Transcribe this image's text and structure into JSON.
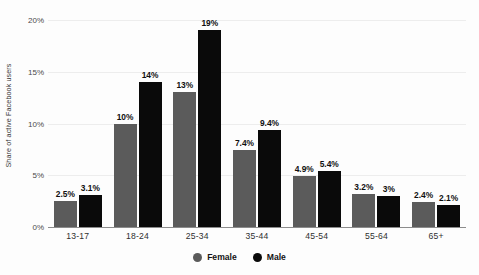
{
  "chart_data": {
    "type": "bar",
    "title": "",
    "xlabel": "",
    "ylabel": "Share of active Facebook users",
    "ylim": [
      0,
      20
    ],
    "ytick_labels": [
      "20%",
      "15%",
      "10%",
      "5%",
      "0%"
    ],
    "ytick_values": [
      20,
      15,
      10,
      5,
      0
    ],
    "grid": true,
    "legend_position": "bottom-center",
    "categories": [
      "13-17",
      "18-24",
      "25-34",
      "35-44",
      "45-54",
      "55-64",
      "65+"
    ],
    "series": [
      {
        "name": "Female",
        "color": "#5b5b5b",
        "values": [
          2.5,
          10,
          13,
          7.4,
          4.9,
          3.2,
          2.4
        ],
        "labels": [
          "2.5%",
          "10%",
          "13%",
          "7.4%",
          "4.9%",
          "3.2%",
          "2.4%"
        ]
      },
      {
        "name": "Male",
        "color": "#0a0a0a",
        "values": [
          3.1,
          14,
          19,
          9.4,
          5.4,
          3.0,
          2.1
        ],
        "labels": [
          "3.1%",
          "14%",
          "19%",
          "9.4%",
          "5.4%",
          "3%",
          "2.1%"
        ]
      }
    ]
  },
  "legend": {
    "items": [
      {
        "label": "Female",
        "color": "#5b5b5b"
      },
      {
        "label": "Male",
        "color": "#0a0a0a"
      }
    ]
  }
}
